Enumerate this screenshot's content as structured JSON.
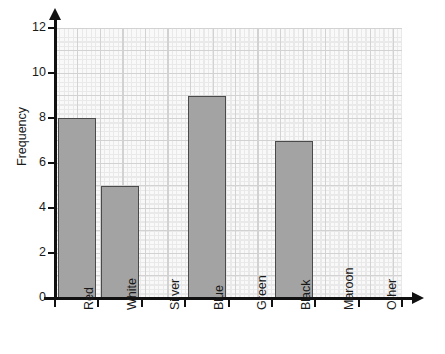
{
  "chart_data": {
    "type": "bar",
    "title": "",
    "xlabel": "",
    "ylabel": "Frequency",
    "categories": [
      "Red",
      "White",
      "Silver",
      "Blue",
      "Green",
      "Black",
      "Maroon",
      "Other"
    ],
    "values": [
      8,
      5,
      0,
      9,
      0,
      7,
      0,
      0
    ],
    "ylim": [
      0,
      12
    ],
    "ytick_labels": [
      "0",
      "2",
      "4",
      "6",
      "8",
      "10",
      "12"
    ],
    "ytick_values": [
      0,
      2,
      4,
      6,
      8,
      10,
      12
    ],
    "grid": "graph-paper-minor-and-major",
    "legend": "none",
    "bar_fill_color": "#a3a3a3",
    "bar_edge_color": "#4a4a4a",
    "axis_color": "#111111",
    "major_grid_color": "#c6c6c6",
    "minor_grid_color": "#e7e7e7",
    "background_color": "#ffffff"
  },
  "axes": {
    "y_title": "Frequency"
  }
}
